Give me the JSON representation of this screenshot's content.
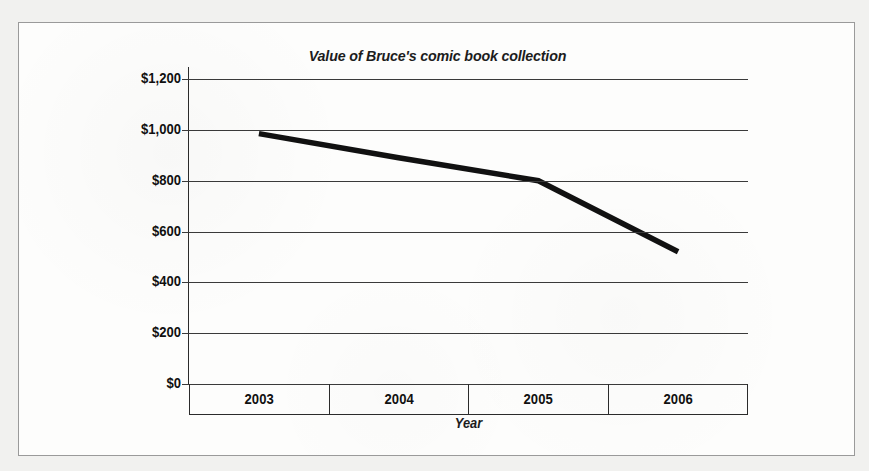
{
  "figure": {
    "title": "Value of Bruce's comic book collection",
    "background_color": "#fdfdfc",
    "page_color": "#f1f1ef",
    "border_color": "#9a9a9a",
    "line_color": "#111111",
    "grid_color": "#3a3a3a"
  },
  "chart_data": {
    "type": "line",
    "title": "Value of Bruce's comic book collection",
    "xlabel": "Year",
    "ylabel": "",
    "categories": [
      "2003",
      "2004",
      "2005",
      "2006"
    ],
    "x": [
      2003,
      2004,
      2005,
      2006
    ],
    "series": [
      {
        "name": "Value of Bruce's comic book collection",
        "values": [
          985,
          890,
          800,
          520
        ]
      }
    ],
    "ylim": [
      0,
      1200
    ],
    "yticks": [
      0,
      200,
      400,
      600,
      800,
      1000,
      1200
    ],
    "ytick_labels": [
      "$0",
      "$200",
      "$400",
      "$600",
      "$800",
      "$1,000",
      "$1,200"
    ],
    "xtick_labels": [
      "2003",
      "2004",
      "2005",
      "2006"
    ],
    "grid": "horizontal",
    "legend": "none",
    "currency_prefix": "$"
  },
  "axes": {
    "y_labels": [
      "$1,200",
      "$1,000",
      "$800",
      "$600",
      "$400",
      "$200",
      "$0"
    ],
    "x_labels": [
      "2003",
      "2004",
      "2005",
      "2006"
    ],
    "x_title": "Year"
  }
}
